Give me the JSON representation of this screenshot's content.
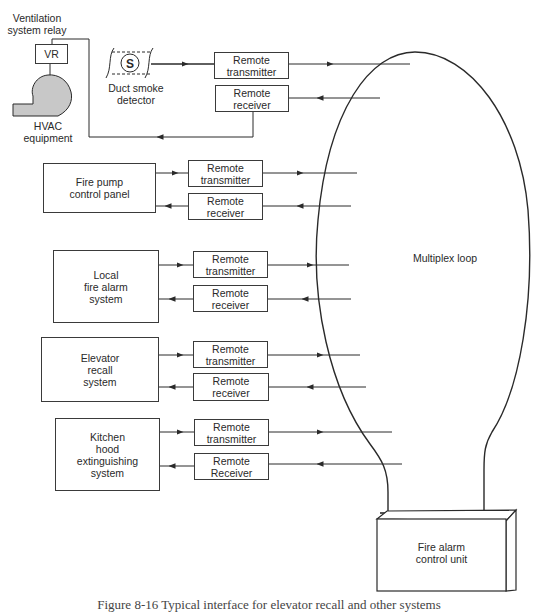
{
  "diagram": {
    "type": "block-diagram",
    "caption": "Figure 8-16   Typical interface for elevator recall and other systems",
    "top_group": {
      "relay_label": "Ventilation\nsystem relay",
      "relay_box": "VR",
      "hvac_label": "HVAC\nequipment",
      "smoke_detector_label": "Duct smoke\ndetector",
      "smoke_detector_symbol": "S",
      "transmitter": "Remote\ntransmitter",
      "receiver": "Remote\nreceiver"
    },
    "systems": [
      {
        "name": "Fire pump\ncontrol panel",
        "transmitter": "Remote\ntransmitter",
        "receiver": "Remote\nreceiver"
      },
      {
        "name": "Local\nfire alarm\nsystem",
        "transmitter": "Remote\ntransmitter",
        "receiver": "Remote\nreceiver"
      },
      {
        "name": "Elevator\nrecall\nsystem",
        "transmitter": "Remote\ntransmitter",
        "receiver": "Remote\nreceiver"
      },
      {
        "name": "Kitchen\nhood\nextinguishing\nsystem",
        "transmitter": "Remote\ntransmitter",
        "receiver": "Remote\nReceiver"
      }
    ],
    "loop_label": "Multiplex loop",
    "control_unit_label": "Fire alarm\ncontrol unit",
    "colors": {
      "line": "#2a2a2a",
      "box_border": "#3a3a3a",
      "hvac_fill": "#c8c8c8",
      "background": "#ffffff"
    }
  }
}
